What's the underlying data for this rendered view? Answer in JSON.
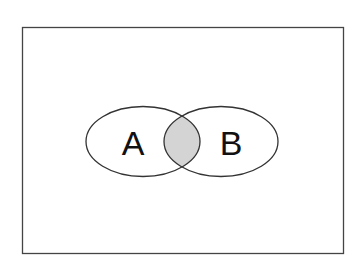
{
  "diagram": {
    "type": "venn",
    "sets": [
      {
        "label": "A"
      },
      {
        "label": "B"
      }
    ],
    "highlighted_region": "A ∩ B",
    "colors": {
      "stroke": "#333333",
      "intersection_fill": "#d4d4d4",
      "background": "#ffffff",
      "frame": "#444444"
    }
  }
}
